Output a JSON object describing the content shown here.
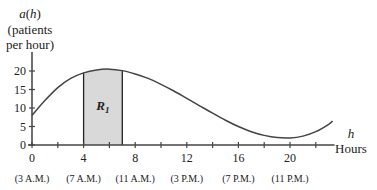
{
  "chart_data": {
    "type": "area",
    "title": "",
    "ylabel_lines": [
      "a(h)",
      "(patients",
      "per hour)"
    ],
    "ylabel_func": "a",
    "ylabel_var": "h",
    "xlabel_var": "h",
    "xlabel": "Hours",
    "xlim": [
      0,
      23.3
    ],
    "ylim": [
      0,
      23
    ],
    "x_ticks": [
      0,
      2,
      4,
      6,
      8,
      10,
      12,
      14,
      16,
      18,
      20,
      22
    ],
    "x_tick_labels": [
      {
        "h": 0,
        "label": "0",
        "time": "(3 A.M.)"
      },
      {
        "h": 4,
        "label": "4",
        "time": "(7 A.M.)"
      },
      {
        "h": 8,
        "label": "8",
        "time": "(11 A.M.)"
      },
      {
        "h": 12,
        "label": "12",
        "time": "(3 P.M.)"
      },
      {
        "h": 16,
        "label": "16",
        "time": "(7 P.M.)"
      },
      {
        "h": 20,
        "label": "20",
        "time": "(11 P.M.)"
      }
    ],
    "y_ticks": [
      0,
      5,
      10,
      15,
      20
    ],
    "y_tick_labels": [
      "0",
      "5",
      "10",
      "15",
      "20"
    ],
    "curve": {
      "x": [
        0,
        1,
        2,
        3,
        4,
        5,
        6,
        7,
        8,
        9,
        10,
        11,
        12,
        13,
        14,
        15,
        16,
        17,
        18,
        19,
        20,
        21,
        22,
        23,
        23.3
      ],
      "y": [
        8,
        12,
        15.5,
        18,
        19.5,
        20.3,
        20.5,
        20.1,
        19.2,
        18,
        16.4,
        14.6,
        12.6,
        10.6,
        8.6,
        6.7,
        5,
        3.6,
        2.6,
        2,
        1.9,
        2.4,
        3.6,
        5.6,
        6.5
      ]
    },
    "shaded_region": {
      "label": "R",
      "subscript": "1",
      "from": 4,
      "to": 7,
      "color": "#d9d9d9"
    },
    "grid": false,
    "legend": null
  }
}
